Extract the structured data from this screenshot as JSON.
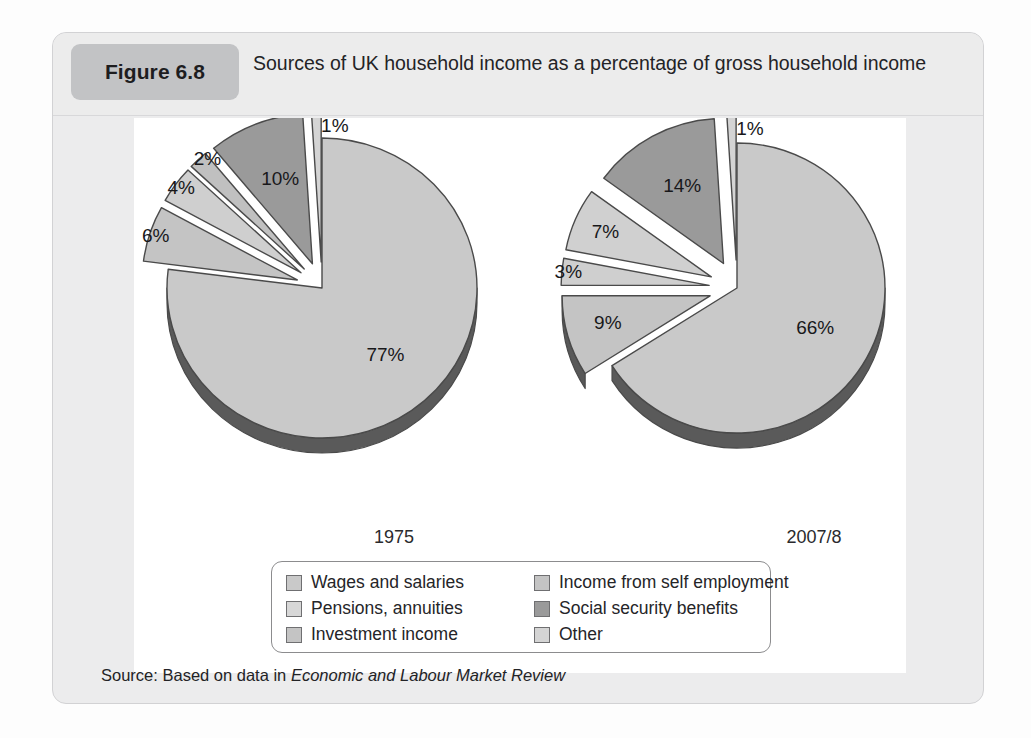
{
  "figure": {
    "badge": "Figure 6.8",
    "title": "Sources of UK household income as a percentage of gross household income",
    "source_prefix": "Source: Based on data in ",
    "source_italic": "Economic and Labour Market Review"
  },
  "colors": {
    "page_background": "#fdfdfd",
    "card_background": "#ececed",
    "badge_background": "#c2c3c5",
    "plot_background": "#ffffff",
    "slice_light": "#c9c9c9",
    "slice_mid": "#bdbdbd",
    "slice_pale": "#dadada",
    "slice_dark": "#9a9a9a",
    "slice_edge": "#4a4a4a",
    "slice_depth": "#555555",
    "text": "#232326"
  },
  "legend": {
    "columns": [
      {
        "items": [
          {
            "label": "Wages and salaries",
            "swatch": "#c9c9c9",
            "swatch_name": "legend-swatch-wages"
          },
          {
            "label": "Pensions, annuities",
            "swatch": "#d7d7d7",
            "swatch_name": "legend-swatch-pensions"
          },
          {
            "label": "Investment income",
            "swatch": "#c4c4c4",
            "swatch_name": "legend-swatch-investment"
          }
        ]
      },
      {
        "items": [
          {
            "label": "Income from self employment",
            "swatch": "#c4c4c4",
            "swatch_name": "legend-swatch-self-employment"
          },
          {
            "label": "Social security benefits",
            "swatch": "#9a9a9a",
            "swatch_name": "legend-swatch-social-security"
          },
          {
            "label": "Other",
            "swatch": "#d4d4d4",
            "swatch_name": "legend-swatch-other"
          }
        ]
      }
    ]
  },
  "chart_data": {
    "type": "pie",
    "title": "Sources of UK household income as a percentage of gross household income",
    "xlabel": "",
    "ylabel": "",
    "value_unit": "%",
    "legend_position": "bottom",
    "grid": false,
    "categories": [
      "Wages and salaries",
      "Income from self employment",
      "Pensions, annuities",
      "Social security benefits",
      "Investment income",
      "Other"
    ],
    "series": [
      {
        "name": "1975",
        "values": [
          77,
          6,
          4,
          2,
          10,
          1
        ],
        "labels": [
          "77%",
          "6%",
          "4%",
          "2%",
          "10%",
          "1%"
        ]
      },
      {
        "name": "2007/8",
        "values": [
          66,
          9,
          3,
          7,
          14,
          1
        ],
        "labels": [
          "66%",
          "9%",
          "3%",
          "7%",
          "14%",
          "1%"
        ]
      }
    ],
    "pies": [
      {
        "name": "1975",
        "year_label": "1975",
        "slices": [
          {
            "category": "Wages and salaries",
            "value": 77,
            "label": "77%",
            "color": "#c9c9c9",
            "exploded": false
          },
          {
            "category": "Income from self employment",
            "value": 6,
            "label": "6%",
            "color": "#c4c4c4",
            "exploded": true
          },
          {
            "category": "Pensions, annuities",
            "value": 4,
            "label": "4%",
            "color": "#cfcfcf",
            "exploded": true
          },
          {
            "category": "Investment income",
            "value": 2,
            "label": "2%",
            "color": "#c0c0c0",
            "exploded": true
          },
          {
            "category": "Social security benefits",
            "value": 10,
            "label": "10%",
            "color": "#9a9a9a",
            "exploded": true
          },
          {
            "category": "Other",
            "value": 1,
            "label": "1%",
            "color": "#d4d4d4",
            "exploded": true
          }
        ]
      },
      {
        "name": "2007/8",
        "year_label": "2007/8",
        "slices": [
          {
            "category": "Wages and salaries",
            "value": 66,
            "label": "66%",
            "color": "#c9c9c9",
            "exploded": false
          },
          {
            "category": "Income from self employment",
            "value": 9,
            "label": "9%",
            "color": "#c4c4c4",
            "exploded": true
          },
          {
            "category": "Pensions, annuities",
            "value": 3,
            "label": "3%",
            "color": "#cfcfcf",
            "exploded": true
          },
          {
            "category": "Investment income",
            "value": 7,
            "label": "7%",
            "color": "#d0d0d0",
            "exploded": true
          },
          {
            "category": "Social security benefits",
            "value": 14,
            "label": "14%",
            "color": "#9a9a9a",
            "exploded": true
          },
          {
            "category": "Other",
            "value": 1,
            "label": "1%",
            "color": "#d4d4d4",
            "exploded": true
          }
        ]
      }
    ]
  }
}
